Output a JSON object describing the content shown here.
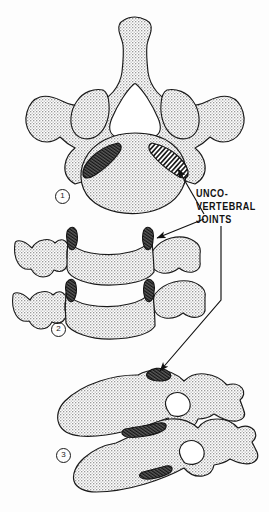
{
  "figure": {
    "background_color": "#fdfdfd",
    "ink_color": "#1a1a1a",
    "bone_fill_color": "#d2d2d2",
    "joint_highlight_color": "#4a4a4a"
  },
  "label": {
    "name": "uncovertebral-joints",
    "line1": "UNCO-",
    "line2": "VERTEBRAL",
    "line3": "JOINTS",
    "full_text": "UNCO-VERTEBRAL JOINTS",
    "color": "#111111",
    "align": "left"
  },
  "panels": [
    {
      "number": "1",
      "view": "superior (axial) view of a cervical vertebra",
      "highlighted_structures": 2
    },
    {
      "number": "2",
      "view": "anterior (coronal) view of two adjacent cervical vertebrae",
      "highlighted_structures": 4
    },
    {
      "number": "3",
      "view": "oblique / lateral view of two adjacent cervical vertebrae",
      "highlighted_structures": 3
    }
  ],
  "leaders": [
    {
      "name": "leader-to-panel-1",
      "from": "label",
      "to": "panel-1-right-uncinate",
      "arrowhead": true
    },
    {
      "name": "leader-to-panel-2",
      "from": "label",
      "to": "panel-2-upper-right-uncinate",
      "arrowhead": true
    },
    {
      "name": "leader-to-panel-3",
      "from": "label",
      "to": "panel-3-upper-joint",
      "arrowhead": true
    }
  ]
}
